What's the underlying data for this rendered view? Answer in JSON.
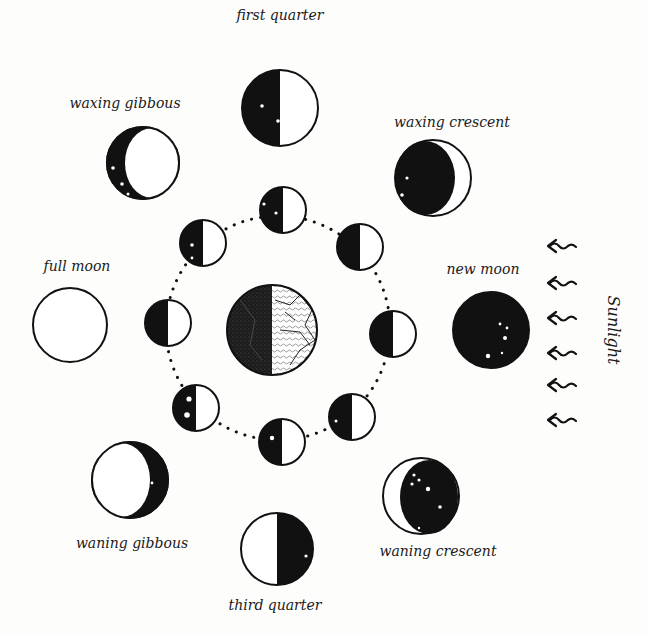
{
  "diagram": {
    "center": {
      "name": "Earth",
      "x": 272,
      "y": 330,
      "r": 45
    },
    "orbit": {
      "cx": 278,
      "cy": 328,
      "r": 112,
      "style": "dotted"
    },
    "sunlight": {
      "label": "Sunlight",
      "direction": "from right to left",
      "arrow_count": 6,
      "arrow_ys": [
        246,
        283,
        318,
        353,
        385,
        420
      ],
      "arrow_x": 560
    },
    "inner_moons": [
      {
        "position": "top",
        "x": 283,
        "y": 210,
        "r": 23,
        "dark_side": "left"
      },
      {
        "position": "top-left",
        "x": 203,
        "y": 243,
        "r": 23,
        "dark_side": "left"
      },
      {
        "position": "top-right",
        "x": 360,
        "y": 247,
        "r": 23,
        "dark_side": "left"
      },
      {
        "position": "left",
        "x": 168,
        "y": 323,
        "r": 23,
        "dark_side": "left"
      },
      {
        "position": "right",
        "x": 393,
        "y": 334,
        "r": 23,
        "dark_side": "left"
      },
      {
        "position": "bottom-left",
        "x": 196,
        "y": 408,
        "r": 23,
        "dark_side": "left"
      },
      {
        "position": "bottom-right",
        "x": 352,
        "y": 417,
        "r": 23,
        "dark_side": "left"
      },
      {
        "position": "bottom",
        "x": 282,
        "y": 442,
        "r": 23,
        "dark_side": "left"
      }
    ],
    "phases": [
      {
        "id": "first-quarter",
        "label": "first quarter",
        "x": 280,
        "y": 108,
        "r": 38,
        "label_x": 280,
        "label_y": 20
      },
      {
        "id": "waxing-gibbous",
        "label": "waxing gibbous",
        "x": 143,
        "y": 163,
        "r": 36,
        "label_x": 125,
        "label_y": 108
      },
      {
        "id": "waxing-crescent",
        "label": "waxing crescent",
        "x": 433,
        "y": 178,
        "r": 38,
        "label_x": 452,
        "label_y": 127
      },
      {
        "id": "full-moon",
        "label": "full moon",
        "x": 70,
        "y": 325,
        "r": 37,
        "label_x": 77,
        "label_y": 271
      },
      {
        "id": "new-moon",
        "label": "new moon",
        "x": 491,
        "y": 330,
        "r": 38,
        "label_x": 483,
        "label_y": 274
      },
      {
        "id": "waning-gibbous",
        "label": "waning gibbous",
        "x": 130,
        "y": 480,
        "r": 38,
        "label_x": 132,
        "label_y": 548
      },
      {
        "id": "third-quarter",
        "label": "third quarter",
        "x": 277,
        "y": 549,
        "r": 36,
        "label_x": 275,
        "label_y": 610
      },
      {
        "id": "waning-crescent",
        "label": "waning crescent",
        "x": 421,
        "y": 496,
        "r": 38,
        "label_x": 438,
        "label_y": 556
      }
    ]
  }
}
